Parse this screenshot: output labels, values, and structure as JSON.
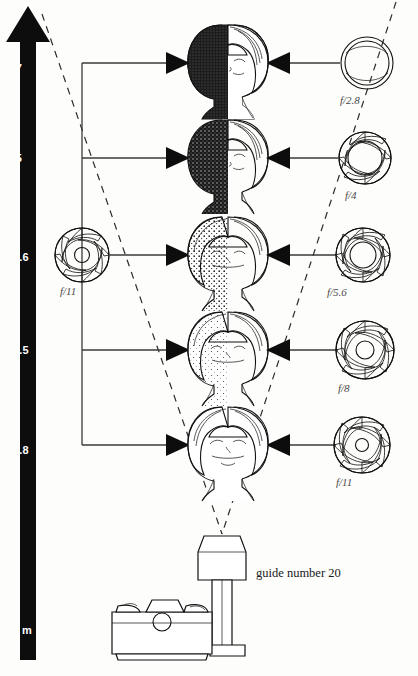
{
  "figure": {
    "background_color": "#fdfdfb",
    "ink_color": "#111111"
  },
  "distance_scale": {
    "name": "distance-scale",
    "unit_label": "m",
    "arrow_direction": "up",
    "bar_color": "#0d0d0d",
    "label_color": "#ffffff",
    "ticks": [
      {
        "value": "7",
        "y": 68
      },
      {
        "value": "5",
        "y": 158
      },
      {
        "value": "3.6",
        "y": 257
      },
      {
        "value": "2.5",
        "y": 350
      },
      {
        "value": "1.8",
        "y": 450
      }
    ]
  },
  "left_aperture": {
    "name": "left-aperture-f11",
    "label": "f/11",
    "openness": 0.3,
    "cx": 82,
    "cy": 255,
    "r": 27
  },
  "rows": [
    {
      "distance": "7",
      "y": 63,
      "face_exposure": "very-dark",
      "darkness": 0.97,
      "right_aperture_label": "f/2.8",
      "right_openness": 1.0
    },
    {
      "distance": "5",
      "y": 158,
      "face_exposure": "dark",
      "darkness": 0.8,
      "right_aperture_label": "f/4",
      "right_openness": 0.82
    },
    {
      "distance": "3.6",
      "y": 255,
      "face_exposure": "medium",
      "darkness": 0.52,
      "right_aperture_label": "f/5.6",
      "right_openness": 0.58
    },
    {
      "distance": "2.5",
      "y": 350,
      "face_exposure": "light",
      "darkness": 0.26,
      "right_aperture_label": "f/8",
      "right_openness": 0.38
    },
    {
      "distance": "1.8",
      "y": 445,
      "face_exposure": "lightest",
      "darkness": 0.05,
      "right_aperture_label": "f/11",
      "right_openness": 0.26
    }
  ],
  "flash": {
    "name": "flash-unit",
    "guide_number_label": "guide number 20",
    "head_x": 222,
    "head_y": 535
  },
  "camera": {
    "name": "camera-body",
    "type": "35mm SLR"
  },
  "beam": {
    "name": "flash-beam-cone",
    "style": "dashed",
    "apex_x": 222,
    "apex_y": 534,
    "left_top_x": 42,
    "right_top_x": 396
  }
}
